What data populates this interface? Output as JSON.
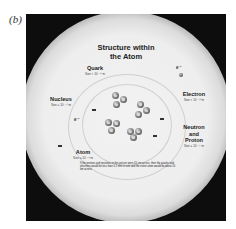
{
  "panel_label": "(b)",
  "diagram": {
    "title_line1": "Structure within",
    "title_line2": "the Atom",
    "labels": {
      "quark": {
        "name": "Quark",
        "size": "Size < 10⁻¹⁹ m"
      },
      "electron": {
        "name": "Electron",
        "size": "Size < 10⁻¹⁸ m"
      },
      "nucleus": {
        "name": "Nucleus",
        "size": "Size = 10⁻¹⁴ m"
      },
      "neutron_proton": {
        "name_line1": "Neutron",
        "name_line2": "and",
        "name_line3": "Proton",
        "size": "Size = 10⁻¹⁵ m"
      },
      "atom": {
        "name": "Atom",
        "size": "Size = 10⁻¹⁰ m"
      }
    },
    "electron_symbol": "e⁻",
    "quark_symbols": {
      "up": "u",
      "down": "d"
    },
    "caption": "If the protons and neutrons in this picture were 10 cm across, then the quarks and electrons would be less than 0.1 mm in size and the entire atom would be about 10 km across.",
    "nucleons": [
      {
        "quarks": [
          "u",
          "d",
          "u"
        ]
      },
      {
        "quarks": [
          "d",
          "u",
          "d"
        ]
      },
      {
        "quarks": [
          "u",
          "d",
          "d"
        ]
      },
      {
        "quarks": [
          "u",
          "u",
          "d"
        ]
      }
    ],
    "colors": {
      "background": "#0d0d0d",
      "glow": "#eeeeee",
      "text": "#222222"
    }
  }
}
